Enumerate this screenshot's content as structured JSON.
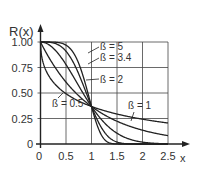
{
  "chart_data": {
    "type": "line",
    "title": "",
    "xlabel": "x",
    "ylabel": "R(x)",
    "xlim": [
      0,
      2.5
    ],
    "ylim": [
      0,
      1.0
    ],
    "grid": true,
    "x_ticks": [
      "0",
      "0.5",
      "1",
      "1.5",
      "2",
      "2.5"
    ],
    "y_ticks": [
      "0",
      "0.25",
      "0.50",
      "0.75",
      "1.00"
    ],
    "function": "R(x) = exp(-x^ß)",
    "series": [
      {
        "name": "ß = 0.5",
        "beta": 0.5,
        "label": "ß = 0.5"
      },
      {
        "name": "ß = 1",
        "beta": 1,
        "label": "ß = 1"
      },
      {
        "name": "ß = 2",
        "beta": 2,
        "label": "ß = 2"
      },
      {
        "name": "ß = 3.4",
        "beta": 3.4,
        "label": "ß = 3.4"
      },
      {
        "name": "ß = 5",
        "beta": 5,
        "label": "ß = 5"
      }
    ],
    "sample_points": {
      "x": [
        0,
        0.5,
        1,
        1.5,
        2,
        2.5
      ],
      "ß = 0.5": [
        1.0,
        0.49,
        0.37,
        0.29,
        0.24,
        0.21
      ],
      "ß = 1": [
        1.0,
        0.61,
        0.37,
        0.22,
        0.14,
        0.08
      ],
      "ß = 2": [
        1.0,
        0.78,
        0.37,
        0.11,
        0.02,
        0.0
      ],
      "ß = 3.4": [
        1.0,
        0.91,
        0.37,
        0.02,
        0.0,
        0.0
      ],
      "ß = 5": [
        1.0,
        0.97,
        0.37,
        0.0,
        0.0,
        0.0
      ]
    }
  },
  "colors": {
    "line": "#222222",
    "grid": "#444444",
    "text": "#333333"
  }
}
